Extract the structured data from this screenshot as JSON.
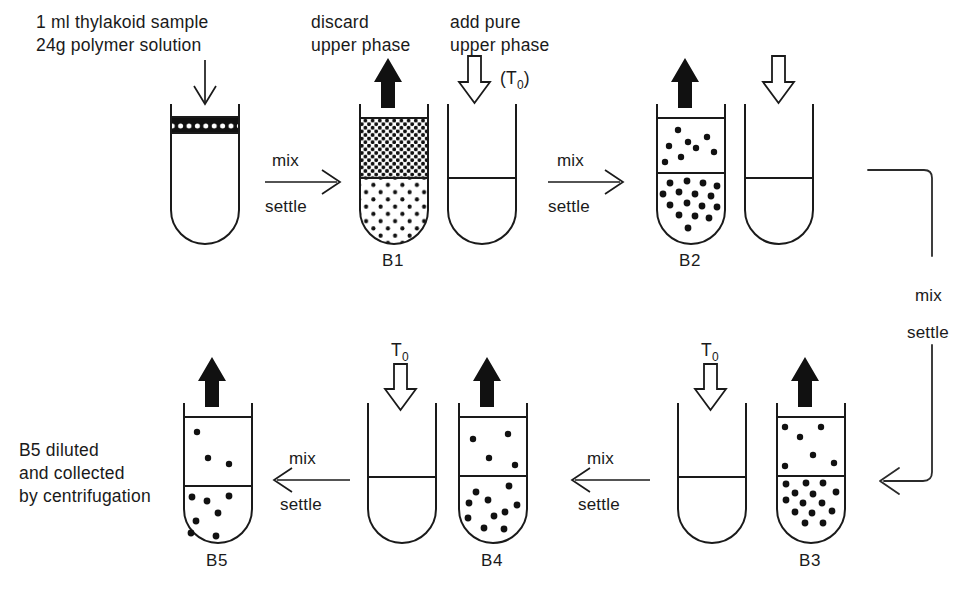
{
  "diagram": {
    "ink_color": "#1a1a1a",
    "background_color": "#ffffff"
  },
  "annotations": {
    "sample_line1": "1 ml thylakoid sample",
    "sample_line2": "24g polymer solution",
    "discard_line1": "discard",
    "discard_line2": "upper  phase",
    "addpure_line1": "add pure",
    "addpure_line2": "upper phase",
    "t_zero_paren": "(T",
    "t_zero_sub": "0",
    "t_zero_close": ")",
    "t_zero_symbol": "T",
    "t_zero_subscript": "0",
    "collect_line1": "B5 diluted",
    "collect_line2": "and  collected",
    "collect_line3": "by centrifugation"
  },
  "steps": [
    {
      "id": "step-1",
      "mix": "mix",
      "settle": "settle",
      "direction": "right"
    },
    {
      "id": "step-2",
      "mix": "mix",
      "settle": "settle",
      "direction": "right"
    },
    {
      "id": "step-3",
      "mix": "mix",
      "settle": "settle",
      "direction": "down-left"
    },
    {
      "id": "step-4",
      "mix": "mix",
      "settle": "settle",
      "direction": "left"
    },
    {
      "id": "step-5",
      "mix": "mix",
      "settle": "settle",
      "direction": "left"
    }
  ],
  "tubes": [
    {
      "id": "tube-start",
      "label": "",
      "content": "thin-band"
    },
    {
      "id": "tube-b1",
      "label": "B1",
      "content": "dense-upper-sparse-lower"
    },
    {
      "id": "tube-fresh-1",
      "label": "",
      "content": "empty"
    },
    {
      "id": "tube-b2",
      "label": "B2",
      "content": "sparse-upper-dense-lower"
    },
    {
      "id": "tube-fresh-2",
      "label": "",
      "content": "empty"
    },
    {
      "id": "tube-b3",
      "label": "B3",
      "content": "sparse-upper-dense-lower"
    },
    {
      "id": "tube-fresh-3",
      "label": "",
      "content": "empty"
    },
    {
      "id": "tube-b4",
      "label": "B4",
      "content": "sparse-upper-medium-lower"
    },
    {
      "id": "tube-fresh-4",
      "label": "",
      "content": "empty"
    },
    {
      "id": "tube-b5",
      "label": "B5",
      "content": "sparse-upper-medium-lower"
    }
  ],
  "labels": {
    "b1": "B1",
    "b2": "B2",
    "b3": "B3",
    "b4": "B4",
    "b5": "B5"
  }
}
